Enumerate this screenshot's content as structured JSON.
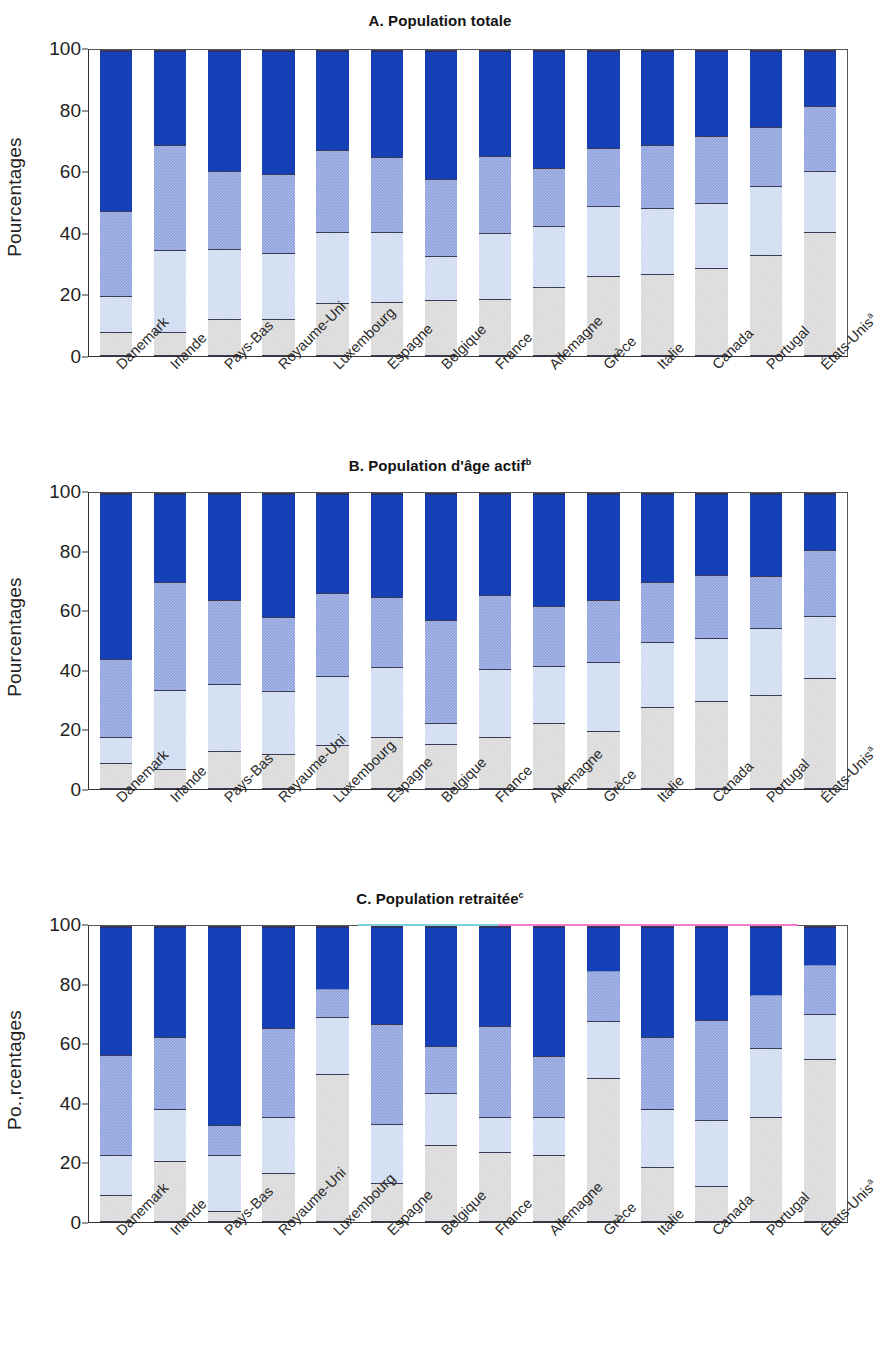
{
  "figure": {
    "y_axis_label": "Pourcentages",
    "y_axis_label_c": "Po.,rcentages",
    "y_ticks": [
      "0",
      "20",
      "40",
      "60",
      "80",
      "100"
    ]
  },
  "categories": [
    "Danemark",
    "Irlande",
    "Pays-Bas",
    "Royaume-Uni",
    "Luxembourg",
    "Espagne",
    "Belgique",
    "France",
    "Allemagne",
    "Grèce",
    "Italie",
    "Canada",
    "Portugal",
    "États-Unis"
  ],
  "category_footnotes": [
    "",
    "",
    "",
    "",
    "",
    "",
    "",
    "",
    "",
    "",
    "",
    "",
    "",
    "a"
  ],
  "panels": [
    {
      "id": "A",
      "title": "A. Population totale",
      "footnote": ""
    },
    {
      "id": "B",
      "title": "B. Population d'âge actif",
      "footnote": "b"
    },
    {
      "id": "C",
      "title": "C. Population retraitée",
      "footnote": "c"
    }
  ],
  "chart_data": [
    {
      "type": "bar",
      "title": "A. Population totale",
      "xlabel": "",
      "ylabel": "Pourcentages",
      "ylim": [
        0,
        100
      ],
      "grid": false,
      "legend": "none",
      "stacked": true,
      "categories": [
        "Danemark",
        "Irlande",
        "Pays-Bas",
        "Royaume-Uni",
        "Luxembourg",
        "Espagne",
        "Belgique",
        "France",
        "Allemagne",
        "Grèce",
        "Italie",
        "Canada",
        "Portugal",
        "États-Unis"
      ],
      "cumulative_boundaries": [
        [
          7.5,
          19.5,
          47.5,
          100
        ],
        [
          7.5,
          34.5,
          69.0,
          100
        ],
        [
          12.0,
          35.0,
          60.5,
          100
        ],
        [
          12.0,
          33.5,
          59.5,
          100
        ],
        [
          17.0,
          40.5,
          67.5,
          100
        ],
        [
          17.5,
          40.5,
          65.0,
          100
        ],
        [
          18.0,
          32.5,
          58.0,
          100
        ],
        [
          18.5,
          40.0,
          65.5,
          100
        ],
        [
          22.5,
          42.5,
          61.5,
          100
        ],
        [
          26.0,
          49.0,
          68.0,
          100
        ],
        [
          26.5,
          48.5,
          69.0,
          100
        ],
        [
          28.5,
          50.0,
          72.0,
          100
        ],
        [
          33.0,
          55.5,
          75.0,
          100
        ],
        [
          40.5,
          60.5,
          82.0,
          100
        ]
      ],
      "series": [
        {
          "name": "segment-1-gray",
          "values": [
            7.5,
            7.5,
            12.0,
            12.0,
            17.0,
            17.5,
            18.0,
            18.5,
            22.5,
            26.0,
            26.5,
            28.5,
            33.0,
            40.5
          ]
        },
        {
          "name": "segment-2-light-blue",
          "values": [
            12.0,
            27.0,
            23.0,
            21.5,
            23.5,
            23.0,
            14.5,
            21.5,
            20.0,
            23.0,
            22.0,
            21.5,
            22.5,
            20.0
          ]
        },
        {
          "name": "segment-3-medium-blue",
          "values": [
            28.0,
            34.5,
            25.5,
            26.0,
            27.0,
            24.5,
            25.5,
            25.5,
            19.0,
            19.0,
            20.5,
            22.0,
            19.5,
            21.5
          ]
        },
        {
          "name": "segment-4-dark-blue",
          "values": [
            52.5,
            31.0,
            39.5,
            40.5,
            32.5,
            35.0,
            42.0,
            34.5,
            38.5,
            32.0,
            31.0,
            28.0,
            25.0,
            18.0
          ]
        }
      ]
    },
    {
      "type": "bar",
      "title": "B. Population d'âge actif",
      "xlabel": "",
      "ylabel": "Pourcentages",
      "ylim": [
        0,
        100
      ],
      "grid": false,
      "legend": "none",
      "stacked": true,
      "categories": [
        "Danemark",
        "Irlande",
        "Pays-Bas",
        "Royaume-Uni",
        "Luxembourg",
        "Espagne",
        "Belgique",
        "France",
        "Allemagne",
        "Grèce",
        "Italie",
        "Canada",
        "Portugal",
        "États-Unis"
      ],
      "cumulative_boundaries": [
        [
          8.5,
          17.5,
          44.0,
          100
        ],
        [
          6.5,
          33.5,
          70.0,
          100
        ],
        [
          12.5,
          35.5,
          64.0,
          100
        ],
        [
          11.5,
          33.0,
          58.0,
          100
        ],
        [
          14.5,
          38.0,
          66.5,
          100
        ],
        [
          17.5,
          41.0,
          65.0,
          100
        ],
        [
          15.0,
          22.0,
          57.0,
          100
        ],
        [
          17.5,
          40.5,
          65.5,
          100
        ],
        [
          22.0,
          41.5,
          62.0,
          100
        ],
        [
          19.5,
          43.0,
          64.0,
          100
        ],
        [
          27.5,
          49.5,
          70.0,
          100
        ],
        [
          29.5,
          51.0,
          72.5,
          100
        ],
        [
          31.5,
          54.5,
          72.0,
          100
        ],
        [
          37.5,
          58.5,
          81.0,
          100
        ]
      ],
      "series": [
        {
          "name": "segment-1-gray",
          "values": [
            8.5,
            6.5,
            12.5,
            11.5,
            14.5,
            17.5,
            15.0,
            17.5,
            22.0,
            19.5,
            27.5,
            29.5,
            31.5,
            37.5
          ]
        },
        {
          "name": "segment-2-light-blue",
          "values": [
            9.0,
            27.0,
            23.0,
            21.5,
            23.5,
            23.5,
            7.0,
            23.0,
            19.5,
            23.5,
            22.0,
            21.5,
            23.0,
            21.0
          ]
        },
        {
          "name": "segment-3-medium-blue",
          "values": [
            26.5,
            36.5,
            28.5,
            25.0,
            28.5,
            24.0,
            35.0,
            25.0,
            20.5,
            21.0,
            20.5,
            21.5,
            17.5,
            22.5
          ]
        },
        {
          "name": "segment-4-dark-blue",
          "values": [
            56.0,
            30.0,
            36.0,
            42.0,
            33.5,
            35.0,
            43.0,
            34.5,
            38.0,
            36.0,
            30.0,
            27.5,
            28.0,
            19.0
          ]
        }
      ]
    },
    {
      "type": "bar",
      "title": "C. Population retraitée",
      "xlabel": "",
      "ylabel": "Pourcentages",
      "ylim": [
        0,
        100
      ],
      "grid": false,
      "legend": "none",
      "stacked": true,
      "categories": [
        "Danemark",
        "Irlande",
        "Pays-Bas",
        "Royaume-Uni",
        "Luxembourg",
        "Espagne",
        "Belgique",
        "France",
        "Allemagne",
        "Grèce",
        "Italie",
        "Canada",
        "Portugal",
        "États-Unis"
      ],
      "cumulative_boundaries": [
        [
          9.0,
          22.5,
          56.5,
          100
        ],
        [
          20.5,
          38.0,
          62.5,
          100
        ],
        [
          3.5,
          22.5,
          32.5,
          100
        ],
        [
          16.5,
          35.5,
          65.5,
          100
        ],
        [
          50.0,
          69.5,
          79.0,
          100
        ],
        [
          13.0,
          33.0,
          67.0,
          100
        ],
        [
          26.0,
          43.5,
          59.5,
          100
        ],
        [
          23.5,
          35.5,
          66.5,
          100
        ],
        [
          22.5,
          35.5,
          56.0,
          100
        ],
        [
          48.5,
          68.0,
          85.0,
          100
        ],
        [
          18.5,
          38.0,
          62.5,
          100
        ],
        [
          12.0,
          34.5,
          68.5,
          100
        ],
        [
          35.5,
          59.0,
          77.0,
          100
        ],
        [
          55.0,
          70.5,
          87.0,
          100
        ]
      ],
      "dotted_third_boundary": [
        false,
        false,
        false,
        false,
        true,
        false,
        false,
        false,
        false,
        true,
        false,
        false,
        true,
        true
      ],
      "series": [
        {
          "name": "segment-1-gray",
          "values": [
            9.0,
            20.5,
            3.5,
            16.5,
            50.0,
            13.0,
            26.0,
            23.5,
            22.5,
            48.5,
            18.5,
            12.0,
            35.5,
            55.0
          ]
        },
        {
          "name": "segment-2-light-blue",
          "values": [
            13.5,
            17.5,
            19.0,
            19.0,
            19.5,
            20.0,
            17.5,
            12.0,
            13.0,
            19.5,
            19.5,
            22.5,
            23.5,
            15.5
          ]
        },
        {
          "name": "segment-3-medium-blue",
          "values": [
            34.0,
            24.5,
            10.0,
            30.0,
            9.5,
            34.0,
            16.0,
            31.0,
            20.5,
            17.0,
            24.5,
            34.0,
            18.0,
            16.5
          ]
        },
        {
          "name": "segment-4-dark-blue",
          "values": [
            43.5,
            37.5,
            67.5,
            34.5,
            21.0,
            33.0,
            40.5,
            33.5,
            44.0,
            15.0,
            37.5,
            31.5,
            23.0,
            13.0
          ]
        }
      ]
    }
  ],
  "colors": {
    "segment_1_gray": "#d9d9d9",
    "segment_2_light_blue": "#cfdcf2",
    "segment_3_medium_blue": "#8da1de",
    "segment_4_dark_blue": "#1540b8",
    "axis": "#333333",
    "artifact_magenta": "#f06ec8",
    "artifact_cyan": "#6ec8d8"
  }
}
